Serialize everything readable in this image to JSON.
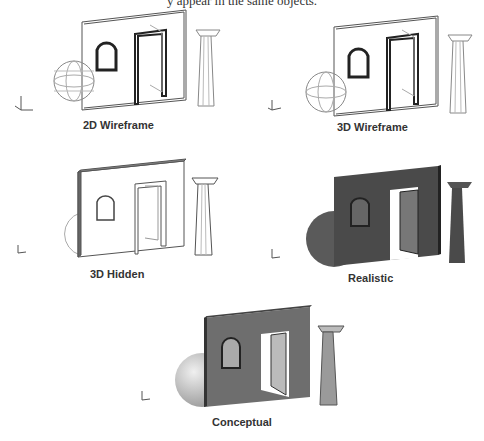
{
  "header": {
    "partial_text": "y appear in the same objects."
  },
  "panels": [
    {
      "id": "2d-wireframe",
      "caption": "2D Wireframe",
      "style": "wireframe-2d"
    },
    {
      "id": "3d-wireframe",
      "caption": "3D Wireframe",
      "style": "wireframe-3d"
    },
    {
      "id": "3d-hidden",
      "caption": "3D Hidden",
      "style": "hidden"
    },
    {
      "id": "realistic",
      "caption": "Realistic",
      "style": "realistic"
    },
    {
      "id": "conceptual",
      "caption": "Conceptual",
      "style": "conceptual"
    }
  ],
  "ucs_icon": {
    "x_label": "X",
    "y_label": "Y",
    "z_label": "Z"
  },
  "colors": {
    "line": "#555555",
    "wall_realistic": "#4a4a4a",
    "wall_conceptual": "#6e6e6e",
    "sphere_realistic": "#5a5a5a",
    "sphere_conceptual": "#cfcfcf"
  }
}
